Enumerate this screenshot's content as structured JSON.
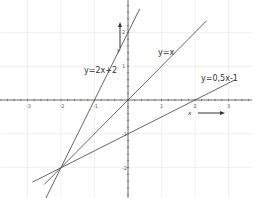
{
  "chart_data": {
    "type": "line",
    "title": "",
    "xlabel": "x",
    "ylabel": "y",
    "xlim": [
      -3.8,
      3.7
    ],
    "ylim": [
      -2.9,
      3.0
    ],
    "grid": true,
    "x_ticks": [
      -3,
      -2,
      -1,
      1,
      2,
      3
    ],
    "y_ticks": [
      -2,
      -1,
      1,
      2
    ],
    "x_tick_labels": [
      "-3",
      "-2",
      "-1",
      "1",
      "2",
      "3"
    ],
    "y_tick_labels": [
      "-2",
      "-1",
      "1",
      "2"
    ],
    "series": [
      {
        "name": "y=2x+2",
        "slope": 2,
        "intercept": 2,
        "x": [
          -2.55,
          0.35
        ],
        "y": [
          -3.1,
          2.7
        ]
      },
      {
        "name": "y=x",
        "slope": 1,
        "intercept": 0,
        "x": [
          -2.5,
          2.35
        ],
        "y": [
          -2.5,
          2.35
        ]
      },
      {
        "name": "y=0,5x-1",
        "slope": 0.5,
        "intercept": -1,
        "x": [
          -2.85,
          3.2
        ],
        "y": [
          -2.43,
          0.6
        ]
      }
    ],
    "annotations": [
      {
        "text": "y=2x+2",
        "x": -1.35,
        "y": 0.9
      },
      {
        "text": "y=x",
        "x": 0.9,
        "y": 1.3
      },
      {
        "text": "y=0,5x-1",
        "x": 2.15,
        "y": 0.65
      },
      {
        "text": "intersection",
        "x": -2,
        "y": -2
      }
    ]
  },
  "labels": {
    "line1": "y=2x+2",
    "line2": "y=x",
    "line3": "y=0,5x-1",
    "x_axis": "x",
    "y_axis": "y"
  },
  "colors": {
    "line": "#555555",
    "axis": "#444444",
    "grid": "#e6e6e6"
  }
}
